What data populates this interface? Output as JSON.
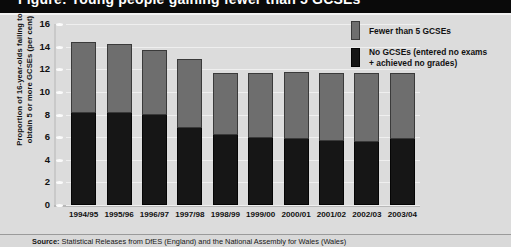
{
  "title_band": {
    "cut_title": "Figure: Young people gaining fewer than 5 GCSEs"
  },
  "source": {
    "label": "Source:",
    "text": "Statistical Releases from DfES (England) and the National Assembly for Wales (Wales)"
  },
  "legend": {
    "items": [
      {
        "label": "Fewer than 5 GCSEs",
        "swatch": "grey",
        "color": "#6e6e6e"
      },
      {
        "label": "No GCSEs (entered no exams\n+ achieved no grades)",
        "swatch": "dark",
        "color": "#161616"
      }
    ]
  },
  "chart_data": {
    "type": "bar",
    "stacked": true,
    "title": "",
    "xlabel": "",
    "ylabel": "Proportion of 16-year-olds failing to\nobtain 5 or more GCSEs (per cent)",
    "ylim": [
      0,
      16
    ],
    "yticks": [
      0,
      2,
      4,
      6,
      8,
      10,
      12,
      14,
      16
    ],
    "ytick_labels": [
      "0",
      "2",
      "4",
      "6",
      "8",
      "10",
      "12",
      "14",
      "16"
    ],
    "grid": true,
    "legend_position": "top-right",
    "categories": [
      "1994/95",
      "1995/96",
      "1996/97",
      "1997/98",
      "1998/99",
      "1999/00",
      "2000/01",
      "2001/02",
      "2002/03",
      "2003/04"
    ],
    "series": [
      {
        "name": "No GCSEs (entered no exams + achieved no grades)",
        "color": "#161616",
        "values": [
          8.1,
          8.1,
          8.0,
          6.8,
          6.2,
          5.9,
          5.8,
          5.7,
          5.6,
          5.8
        ]
      },
      {
        "name": "Fewer than 5 GCSEs",
        "color": "#6e6e6e",
        "values": [
          6.3,
          6.1,
          5.7,
          6.1,
          5.5,
          5.8,
          6.0,
          6.0,
          6.1,
          5.9
        ]
      }
    ],
    "totals": [
      14.4,
      14.2,
      13.7,
      12.9,
      11.7,
      11.7,
      11.8,
      11.7,
      11.7,
      11.7
    ]
  }
}
